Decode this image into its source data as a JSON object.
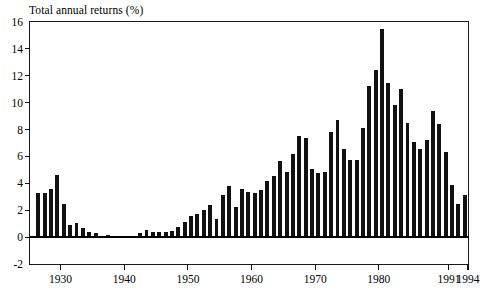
{
  "chart_data": {
    "type": "bar",
    "title": "Total annual returns (%)",
    "xlabel": "",
    "ylabel": "",
    "ylim": [
      -2,
      16
    ],
    "xlim": [
      1925.2,
      1994.0
    ],
    "grid": false,
    "legend": null,
    "ytick_labels": [
      "16",
      "14",
      "12",
      "10",
      "8",
      "6",
      "4",
      "2",
      "0",
      "-2"
    ],
    "ytick_values": [
      16,
      14,
      12,
      10,
      8,
      6,
      4,
      2,
      0,
      -2
    ],
    "xtick_labels": [
      "1930",
      "1940",
      "1950",
      "1960",
      "1970",
      "1980",
      "1991",
      "1994"
    ],
    "xtick_values": [
      1930,
      1940,
      1950,
      1960,
      1970,
      1980,
      1991,
      1994
    ],
    "bar_color": "#111111",
    "categories": [
      1926,
      1927,
      1928,
      1929,
      1930,
      1931,
      1932,
      1933,
      1934,
      1935,
      1936,
      1937,
      1938,
      1939,
      1940,
      1941,
      1942,
      1943,
      1944,
      1945,
      1946,
      1947,
      1948,
      1949,
      1950,
      1951,
      1952,
      1953,
      1954,
      1955,
      1956,
      1957,
      1958,
      1959,
      1960,
      1961,
      1962,
      1963,
      1964,
      1965,
      1966,
      1967,
      1968,
      1969,
      1970,
      1971,
      1972,
      1973,
      1974,
      1975,
      1976,
      1977,
      1978,
      1979,
      1980,
      1981,
      1982,
      1983,
      1984,
      1985,
      1986,
      1987,
      1988,
      1989,
      1990,
      1991,
      1992,
      1993
    ],
    "values": [
      3.3,
      3.25,
      3.55,
      4.6,
      2.45,
      0.9,
      1.05,
      0.65,
      0.35,
      0.3,
      0.1,
      0.12,
      0.02,
      0.02,
      0.02,
      0.02,
      0.3,
      0.5,
      0.35,
      0.4,
      0.4,
      0.45,
      0.75,
      1.1,
      1.55,
      1.75,
      2.0,
      2.4,
      1.35,
      3.1,
      3.8,
      2.25,
      3.6,
      3.35,
      3.3,
      3.5,
      4.2,
      4.55,
      5.65,
      4.85,
      6.15,
      7.5,
      7.4,
      5.05,
      4.75,
      4.85,
      7.8,
      8.7,
      6.55,
      5.75,
      5.75,
      8.1,
      11.25,
      12.4,
      15.5,
      11.5,
      9.8,
      11.0,
      8.5,
      7.1,
      6.55,
      7.2,
      9.4,
      8.4,
      6.35,
      3.9,
      2.45,
      3.15
    ],
    "series": [
      {
        "name": "Total annual returns",
        "values": [
          3.3,
          3.25,
          3.55,
          4.6,
          2.45,
          0.9,
          1.05,
          0.65,
          0.35,
          0.3,
          0.1,
          0.12,
          0.02,
          0.02,
          0.02,
          0.02,
          0.3,
          0.5,
          0.35,
          0.4,
          0.4,
          0.45,
          0.75,
          1.1,
          1.55,
          1.75,
          2.0,
          2.4,
          1.35,
          3.1,
          3.8,
          2.25,
          3.6,
          3.35,
          3.3,
          3.5,
          4.2,
          4.55,
          5.65,
          4.85,
          6.15,
          7.5,
          7.4,
          5.05,
          4.75,
          4.85,
          7.8,
          8.7,
          6.55,
          5.75,
          5.75,
          8.1,
          11.25,
          12.4,
          15.5,
          11.5,
          9.8,
          11.0,
          8.5,
          7.1,
          6.55,
          7.2,
          9.4,
          8.4,
          6.35,
          3.9,
          2.45,
          3.15
        ]
      }
    ]
  }
}
